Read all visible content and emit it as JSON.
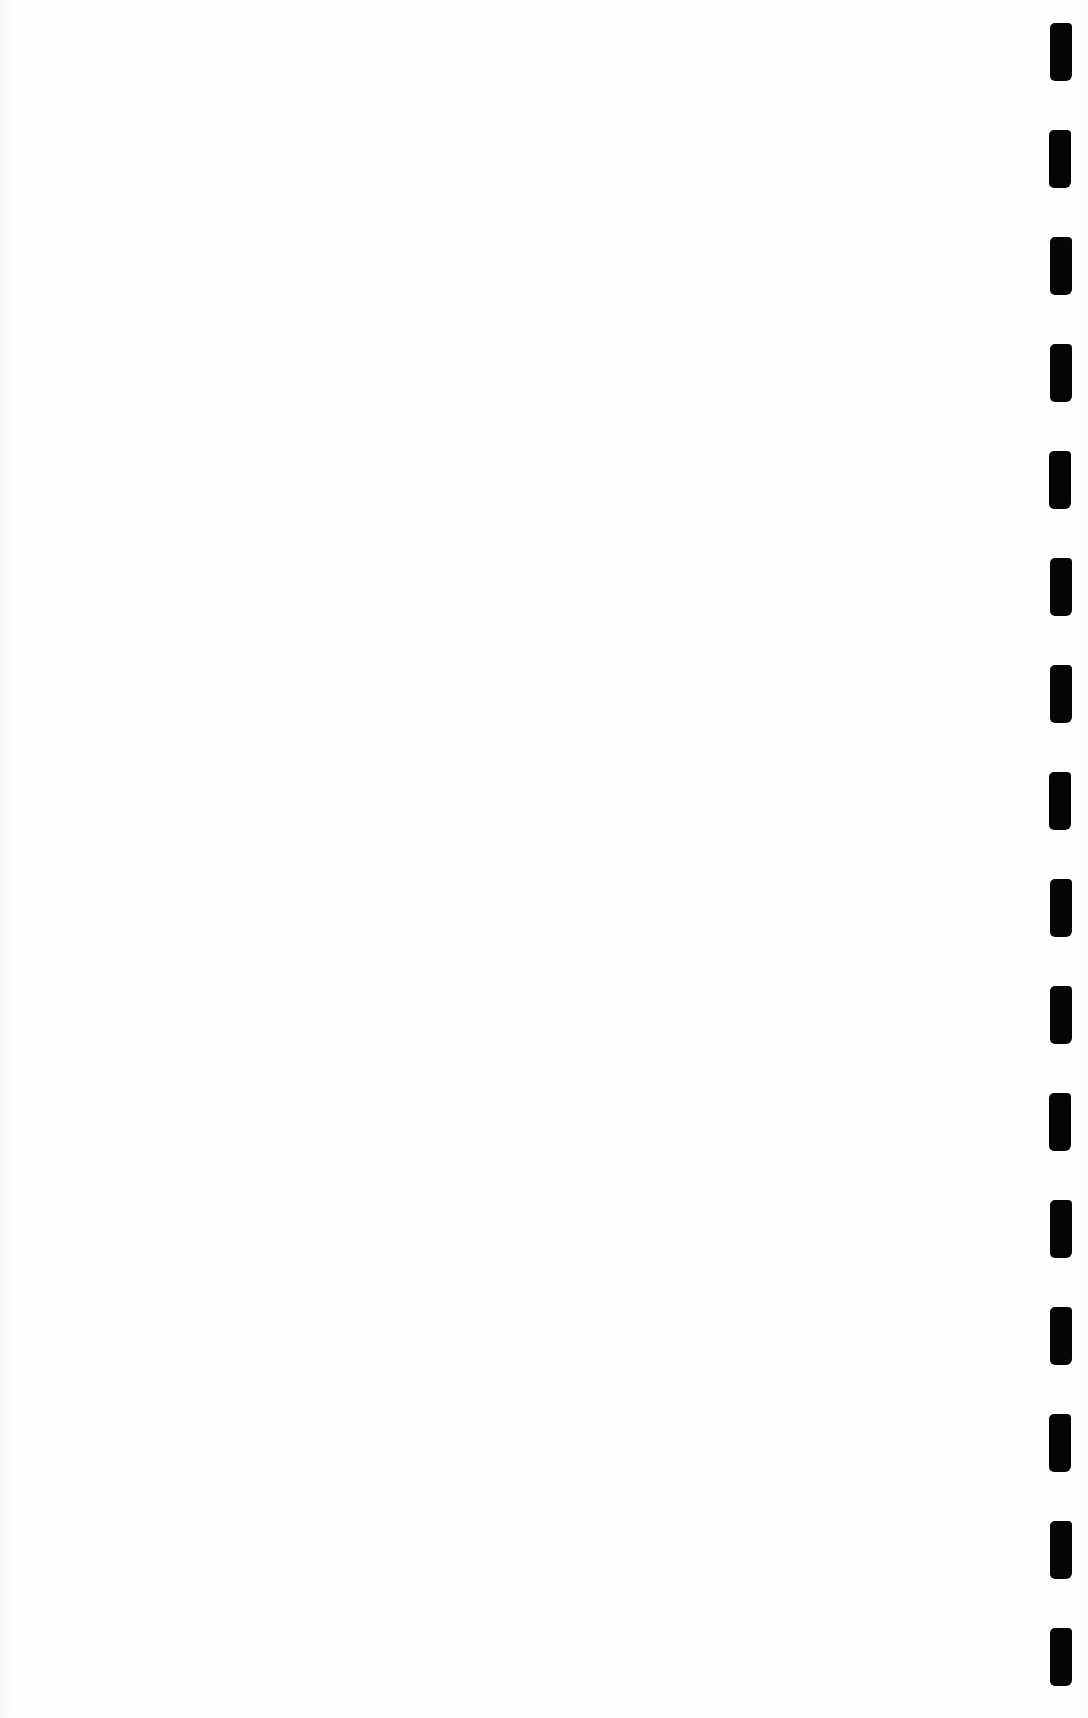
{
  "document": {
    "type": "blank scanned page",
    "text": "",
    "background_color": "#fdfdfd"
  },
  "binding": {
    "side": "right",
    "mark_color": "#050505",
    "mark_count": 17,
    "marks": [
      {
        "top": 23
      },
      {
        "top": 130
      },
      {
        "top": 237
      },
      {
        "top": 344
      },
      {
        "top": 451
      },
      {
        "top": 558
      },
      {
        "top": 665
      },
      {
        "top": 772
      },
      {
        "top": 879
      },
      {
        "top": 986
      },
      {
        "top": 1093
      },
      {
        "top": 1200
      },
      {
        "top": 1307
      },
      {
        "top": 1414
      },
      {
        "top": 1521
      },
      {
        "top": 1628
      }
    ]
  }
}
